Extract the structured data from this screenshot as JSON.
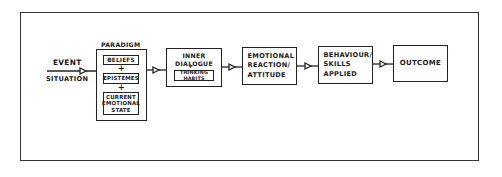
{
  "diagram": {
    "input": {
      "label_top": "EVENT",
      "label_bottom": "SITUATION"
    },
    "paradigm": {
      "title": "PARADIGM",
      "components": [
        "BELIEFS",
        "EPISTEMES",
        "CURRENT EMOTIONAL STATE"
      ],
      "separator": "+"
    },
    "inner_dialogue": {
      "title": "INNER DIALOGUE",
      "separator": "+",
      "sub": "THINKING HABITS"
    },
    "emotional_reaction": {
      "text": "EMOTIONAL REACTION/ ATTITUDE"
    },
    "behaviour": {
      "text": "BEHAVIOUR/ SKILLS APPLIED"
    },
    "outcome": {
      "text": "OUTCOME"
    },
    "flow": [
      "EVENT / SITUATION",
      "PARADIGM",
      "INNER DIALOGUE + THINKING HABITS",
      "EMOTIONAL REACTION/ ATTITUDE",
      "BEHAVIOUR/ SKILLS APPLIED",
      "OUTCOME"
    ],
    "colors": {
      "ink": "#1a1a1a",
      "background": "#ffffff"
    }
  }
}
